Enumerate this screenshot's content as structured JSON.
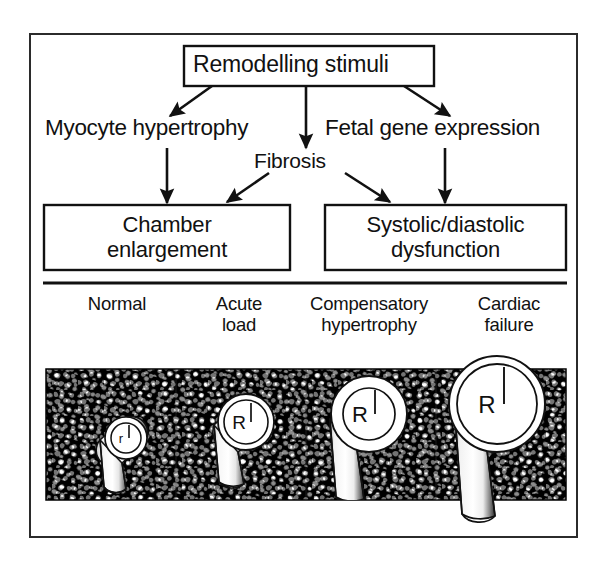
{
  "figure": {
    "title_box": {
      "label": "Remodelling stimuli"
    },
    "mediators": [
      {
        "id": "myocyte",
        "label": "Myocyte hypertrophy"
      },
      {
        "id": "fibrosis",
        "label": "Fibrosis"
      },
      {
        "id": "fetal",
        "label": "Fetal gene expression"
      }
    ],
    "outcome_boxes": [
      {
        "id": "chamber",
        "line1": "Chamber",
        "line2": "enlargement"
      },
      {
        "id": "dysfunction",
        "line1": "Systolic/diastolic",
        "line2": "dysfunction"
      }
    ],
    "stages": [
      {
        "id": "normal",
        "line1": "Normal",
        "line2": "",
        "radius_label": "r"
      },
      {
        "id": "acute-load",
        "line1": "Acute",
        "line2": "load",
        "radius_label": "R"
      },
      {
        "id": "compensatory",
        "line1": "Compensatory",
        "line2": "hypertrophy",
        "radius_label": "R"
      },
      {
        "id": "cardiac-failure",
        "line1": "Cardiac",
        "line2": "failure",
        "radius_label": "R"
      }
    ],
    "colors": {
      "ink": "#111111",
      "frame": "#2b2b2b",
      "panel_fill": "#000000",
      "paper": "#ffffff"
    }
  }
}
